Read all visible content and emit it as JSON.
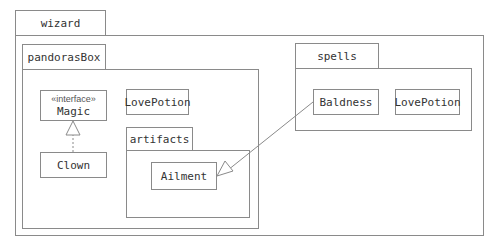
{
  "diagram": {
    "type": "UML package diagram",
    "packages": {
      "wizard": {
        "label": "wizard"
      },
      "pandorasBox": {
        "label": "pandorasBox"
      },
      "artifacts": {
        "label": "artifacts"
      },
      "spells": {
        "label": "spells"
      }
    },
    "classes": {
      "magic": {
        "stereotype": "«interface»",
        "name": "Magic"
      },
      "clown": {
        "name": "Clown"
      },
      "lovePotionPandora": {
        "name": "LovePotion"
      },
      "ailment": {
        "name": "Ailment"
      },
      "baldness": {
        "name": "Baldness"
      },
      "lovePotionSpells": {
        "name": "LovePotion"
      }
    },
    "relationships": [
      {
        "from": "Clown",
        "to": "Magic",
        "kind": "realization"
      },
      {
        "from": "Baldness",
        "to": "Ailment",
        "kind": "generalization"
      }
    ],
    "colors": {
      "line": "#8a8a8a",
      "text": "#333333",
      "background": "#ffffff"
    }
  }
}
